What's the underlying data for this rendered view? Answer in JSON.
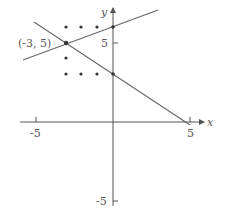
{
  "diagram": {
    "type": "coordinate_plane",
    "axes": {
      "x_label": "x",
      "y_label": "y",
      "x_ticks": [
        {
          "value": -5,
          "label": "-5"
        },
        {
          "value": 5,
          "label": "5"
        }
      ],
      "y_ticks": [
        {
          "value": 5,
          "label": "5"
        },
        {
          "value": -5,
          "label": "-5"
        }
      ]
    },
    "highlighted_point": {
      "x": -3,
      "y": 5,
      "label": "(-3, 5)"
    },
    "lattice_points": [
      {
        "x": -3,
        "y": 6
      },
      {
        "x": -2,
        "y": 6
      },
      {
        "x": -1,
        "y": 6
      },
      {
        "x": 0,
        "y": 6
      },
      {
        "x": -3,
        "y": 4
      },
      {
        "x": -3,
        "y": 3
      },
      {
        "x": -2,
        "y": 3
      },
      {
        "x": -1,
        "y": 3
      },
      {
        "x": 0,
        "y": 3
      }
    ],
    "lines": [
      {
        "name": "line-through-(-3,5)-and-(0,6)",
        "slope": "1/3",
        "points": [
          {
            "x": -3,
            "y": 5
          },
          {
            "x": 0,
            "y": 6
          }
        ]
      },
      {
        "name": "line-through-(-3,5)-and-(0,3)",
        "slope": "-2/3",
        "points": [
          {
            "x": -3,
            "y": 5
          },
          {
            "x": 0,
            "y": 3
          }
        ]
      }
    ],
    "colors": {
      "axis": "#555555",
      "line": "#666666",
      "point": "#333333",
      "text": "#555555"
    }
  }
}
